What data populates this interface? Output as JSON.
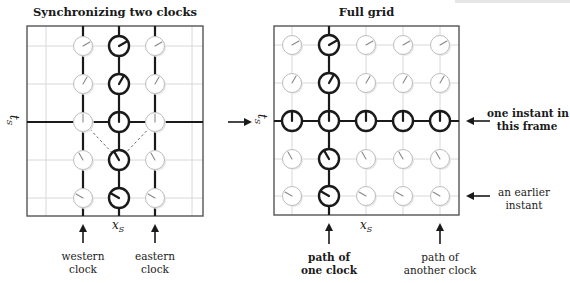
{
  "left_panel": {
    "title": "Synchronizing two clocks",
    "x_axis_label": "x",
    "x_axis_sub": "S",
    "t_axis_label": "t",
    "t_axis_sub": "S",
    "annotations": [
      {
        "id": "western",
        "lines": [
          "western",
          "clock"
        ]
      },
      {
        "id": "eastern",
        "lines": [
          "eastern",
          "clock"
        ]
      }
    ],
    "columns": [
      83,
      119,
      155
    ],
    "rows": [
      46,
      84,
      122,
      160,
      198
    ],
    "clocks": [
      {
        "col": 0,
        "row": 0,
        "style": "light",
        "hand_deg": 60
      },
      {
        "col": 1,
        "row": 0,
        "style": "bold",
        "hand_deg": 60
      },
      {
        "col": 2,
        "row": 0,
        "style": "light",
        "hand_deg": 60
      },
      {
        "col": 0,
        "row": 1,
        "style": "light",
        "hand_deg": 30
      },
      {
        "col": 1,
        "row": 1,
        "style": "bold",
        "hand_deg": 30
      },
      {
        "col": 2,
        "row": 1,
        "style": "light",
        "hand_deg": 30
      },
      {
        "col": 0,
        "row": 2,
        "style": "light",
        "hand_deg": 0
      },
      {
        "col": 1,
        "row": 2,
        "style": "bold",
        "hand_deg": 0
      },
      {
        "col": 2,
        "row": 2,
        "style": "light",
        "hand_deg": 0
      },
      {
        "col": 0,
        "row": 3,
        "style": "light",
        "hand_deg": -30
      },
      {
        "col": 1,
        "row": 3,
        "style": "bold",
        "hand_deg": -30
      },
      {
        "col": 2,
        "row": 3,
        "style": "light",
        "hand_deg": -30
      },
      {
        "col": 0,
        "row": 4,
        "style": "light",
        "hand_deg": -60
      },
      {
        "col": 1,
        "row": 4,
        "style": "bold",
        "hand_deg": -60
      },
      {
        "col": 2,
        "row": 4,
        "style": "light",
        "hand_deg": -60
      }
    ]
  },
  "transition_arrow": "right-arrow",
  "right_panel": {
    "title": "Full grid",
    "x_axis_label": "x",
    "x_axis_sub": "S",
    "t_axis_label": "t",
    "t_axis_sub": "S",
    "annotations": [
      {
        "id": "one-instant",
        "lines": [
          "one instant in",
          "this frame"
        ],
        "bold": true
      },
      {
        "id": "earlier-instant",
        "lines": [
          "an earlier",
          "instant"
        ],
        "bold": false
      },
      {
        "id": "path-one-clock",
        "lines": [
          "path of",
          "one clock"
        ],
        "bold": true
      },
      {
        "id": "path-another-clock",
        "lines": [
          "path of",
          "another clock"
        ],
        "bold": false
      }
    ],
    "columns": [
      292,
      329,
      366,
      403,
      440
    ],
    "rows": [
      45,
      83,
      121,
      159,
      196
    ],
    "row_hand_deg": [
      60,
      30,
      0,
      -30,
      -60
    ],
    "bold_column": 1,
    "bold_row": 2
  },
  "colors": {
    "ink": "#1a1a1a",
    "grid": "#d8d8d8",
    "light_clock": "#bdbdbd",
    "frame": "#555555",
    "dashed": "#666666"
  }
}
